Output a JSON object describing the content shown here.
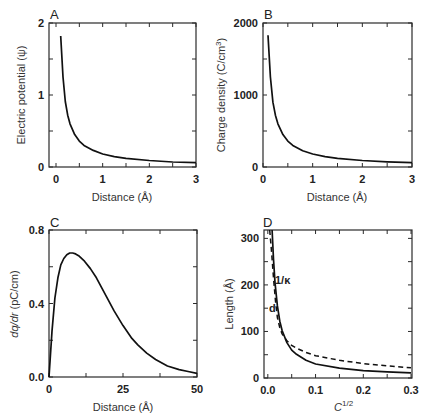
{
  "chart_data": [
    {
      "panel": "A",
      "type": "line",
      "title": "",
      "xlabel": "Distance (Å)",
      "ylabel": "Electric potential (ψ)",
      "xlim": [
        -0.15,
        3
      ],
      "ylim": [
        0,
        2
      ],
      "xticks": [
        "0",
        "1",
        "2",
        "3"
      ],
      "yticks": [
        "0",
        "1",
        "2"
      ],
      "series": [
        {
          "name": "ψ",
          "style": "solid",
          "x": [
            0.1,
            0.15,
            0.2,
            0.25,
            0.3,
            0.4,
            0.5,
            0.6,
            0.8,
            1.0,
            1.25,
            1.5,
            2.0,
            2.5,
            3.0
          ],
          "y": [
            1.82,
            1.25,
            0.91,
            0.72,
            0.6,
            0.45,
            0.36,
            0.3,
            0.23,
            0.18,
            0.145,
            0.12,
            0.09,
            0.07,
            0.06
          ]
        }
      ]
    },
    {
      "panel": "B",
      "type": "line",
      "title": "",
      "xlabel": "Distance (Å)",
      "ylabel": "Charge density (C/cm³)",
      "xlim": [
        0,
        3
      ],
      "ylim": [
        0,
        2000
      ],
      "xticks": [
        "0",
        "1",
        "2",
        "3"
      ],
      "yticks": [
        "0",
        "1000",
        "2000"
      ],
      "series": [
        {
          "name": "charge density",
          "style": "solid",
          "x": [
            0.1,
            0.15,
            0.2,
            0.25,
            0.3,
            0.4,
            0.5,
            0.6,
            0.8,
            1.0,
            1.25,
            1.5,
            2.0,
            2.5,
            3.0
          ],
          "y": [
            1830,
            1250,
            900,
            720,
            600,
            450,
            360,
            300,
            225,
            180,
            145,
            120,
            90,
            72,
            60
          ]
        }
      ]
    },
    {
      "panel": "C",
      "type": "line",
      "title": "",
      "xlabel": "Distance (Å)",
      "ylabel": "dq/dr (pC/cm)",
      "xlim": [
        0,
        50
      ],
      "ylim": [
        0,
        0.8
      ],
      "xticks": [
        "0",
        "25",
        "50"
      ],
      "yticks": [
        "0.0",
        "0.4",
        "0.8"
      ],
      "series": [
        {
          "name": "dq/dr",
          "style": "solid",
          "x": [
            0,
            1,
            2,
            3,
            4,
            5,
            6,
            7,
            8,
            9,
            10,
            12,
            14,
            16,
            18,
            20,
            22,
            25,
            28,
            30,
            33,
            36,
            40,
            44,
            47,
            50
          ],
          "y": [
            0,
            0.25,
            0.43,
            0.54,
            0.61,
            0.645,
            0.665,
            0.675,
            0.675,
            0.67,
            0.66,
            0.63,
            0.59,
            0.54,
            0.48,
            0.42,
            0.36,
            0.28,
            0.21,
            0.175,
            0.13,
            0.095,
            0.06,
            0.04,
            0.03,
            0.02
          ]
        }
      ]
    },
    {
      "panel": "D",
      "type": "line",
      "title": "",
      "xlabel": "C^1/2",
      "ylabel": "Length (Å)",
      "xlim": [
        -0.008,
        0.302
      ],
      "ylim": [
        0,
        318
      ],
      "xticks": [
        "0.0",
        "0.1",
        "0.2",
        "0.3"
      ],
      "yticks": [
        "0",
        "100",
        "200",
        "300"
      ],
      "annotations": [
        "1/κ",
        "d"
      ],
      "series": [
        {
          "name": "1/κ",
          "style": "solid",
          "x": [
            0.009,
            0.012,
            0.015,
            0.02,
            0.025,
            0.03,
            0.04,
            0.05,
            0.06,
            0.08,
            0.1,
            0.15,
            0.2,
            0.25,
            0.3
          ],
          "y": [
            318,
            255,
            205,
            155,
            122,
            102,
            76,
            60,
            51,
            38,
            30,
            21,
            16,
            13,
            11
          ]
        },
        {
          "name": "d",
          "style": "dashed",
          "x": [
            0.004,
            0.008,
            0.012,
            0.016,
            0.02,
            0.025,
            0.03,
            0.04,
            0.05,
            0.06,
            0.08,
            0.1,
            0.15,
            0.2,
            0.25,
            0.3
          ],
          "y": [
            318,
            270,
            215,
            165,
            130,
            108,
            95,
            80,
            70,
            64,
            55,
            48,
            38,
            31,
            26,
            22
          ]
        }
      ]
    }
  ],
  "labels": {
    "panelA": "A",
    "panelB": "B",
    "panelC": "C",
    "panelD": "D",
    "a_xlabel": "Distance (Å)",
    "a_ylabel": "Electric potential (ψ)",
    "b_xlabel": "Distance (Å)",
    "b_ylabel_pre": "Charge density (C/cm",
    "b_ylabel_sup": "3",
    "b_ylabel_post": ")",
    "c_xlabel": "Distance (Å)",
    "c_ylabel_it": "dq/dr",
    "c_ylabel_post": " (pC/cm)",
    "d_xlabel_base": "C",
    "d_xlabel_sup": "1/2",
    "d_ylabel": "Length (Å)",
    "d_annot_kappa": "1/κ",
    "d_annot_d": "d"
  }
}
